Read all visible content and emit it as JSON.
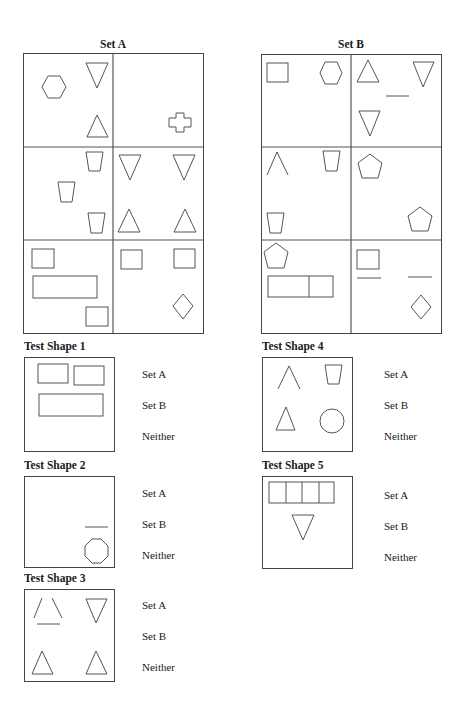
{
  "set_a": {
    "title": "Set A",
    "box": {
      "x": 23,
      "y": 53,
      "w": 180,
      "h": 280
    },
    "cells": [
      {
        "row": 0,
        "col": 0,
        "shapes": [
          "hexagon",
          "triangle-down",
          "triangle-up"
        ]
      },
      {
        "row": 0,
        "col": 1,
        "shapes": [
          "cross"
        ]
      },
      {
        "row": 1,
        "col": 0,
        "shapes": [
          "trapezoid",
          "trapezoid",
          "trapezoid"
        ]
      },
      {
        "row": 1,
        "col": 1,
        "shapes": [
          "triangle-down",
          "triangle-down",
          "triangle-up",
          "triangle-up"
        ]
      },
      {
        "row": 2,
        "col": 0,
        "shapes": [
          "square",
          "rectangle",
          "square"
        ]
      },
      {
        "row": 2,
        "col": 1,
        "shapes": [
          "square",
          "square",
          "diamond"
        ]
      }
    ]
  },
  "set_b": {
    "title": "Set B",
    "box": {
      "x": 261,
      "y": 54,
      "w": 180,
      "h": 279
    },
    "cells": [
      {
        "row": 0,
        "col": 0,
        "shapes": [
          "square",
          "hexagon"
        ]
      },
      {
        "row": 0,
        "col": 1,
        "shapes": [
          "triangle-up",
          "triangle-down",
          "line",
          "triangle-down"
        ]
      },
      {
        "row": 1,
        "col": 0,
        "shapes": [
          "open-triangle",
          "trapezoid",
          "trapezoid"
        ]
      },
      {
        "row": 1,
        "col": 1,
        "shapes": [
          "pentagon",
          "pentagon"
        ]
      },
      {
        "row": 2,
        "col": 0,
        "shapes": [
          "pentagon",
          "rectangle-split-2"
        ]
      },
      {
        "row": 2,
        "col": 1,
        "shapes": [
          "square",
          "line",
          "line",
          "diamond"
        ]
      }
    ]
  },
  "tests": [
    {
      "label": "Test Shape 1",
      "shapes": [
        "rectangle",
        "rectangle",
        "rectangle"
      ],
      "options": [
        "Set A",
        "Set B",
        "Neither"
      ]
    },
    {
      "label": "Test Shape 2",
      "shapes": [
        "line",
        "octagon"
      ],
      "options": [
        "Set A",
        "Set B",
        "Neither"
      ]
    },
    {
      "label": "Test Shape 3",
      "shapes": [
        "broken-triangle",
        "triangle-down",
        "triangle-up",
        "triangle-up"
      ],
      "options": [
        "Set A",
        "Set B",
        "Neither"
      ]
    },
    {
      "label": "Test Shape 4",
      "shapes": [
        "open-triangle",
        "trapezoid",
        "triangle-up",
        "circle"
      ],
      "options": [
        "Set A",
        "Set B",
        "Neither"
      ]
    },
    {
      "label": "Test Shape 5",
      "shapes": [
        "rectangle-split-4",
        "triangle-down"
      ],
      "options": [
        "Set A",
        "Set B",
        "Neither"
      ]
    }
  ],
  "colors": {
    "stroke": "#555555",
    "border": "#444444",
    "text": "#1a1a1a",
    "background": "#ffffff"
  }
}
